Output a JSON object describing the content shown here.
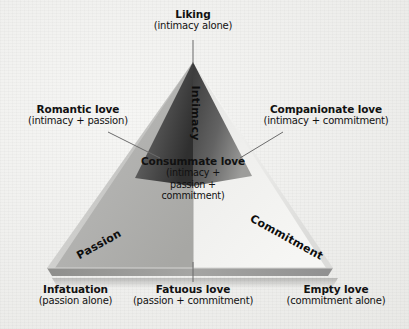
{
  "figure": {
    "name": "triangular-theory-of-love",
    "background_color": "#f1f1ef"
  },
  "vertices": {
    "top": {
      "title": "Liking",
      "subtitle": "(intimacy alone)"
    },
    "bottom_left": {
      "title": "Infatuation",
      "subtitle": "(passion alone)"
    },
    "bottom_right": {
      "title": "Empty love",
      "subtitle": "(commitment alone)"
    }
  },
  "sides": {
    "left": {
      "title": "Romantic love",
      "subtitle": "(intimacy + passion)"
    },
    "right": {
      "title": "Companionate love",
      "subtitle": "(intimacy + commitment)"
    },
    "bottom": {
      "title": "Fatuous love",
      "subtitle": "(passion + commitment)"
    }
  },
  "center": {
    "title": "Consummate love",
    "subtitle_line1": "(intimacy +",
    "subtitle_line2": "passion +",
    "subtitle_line3": "commitment)"
  },
  "faces": {
    "intimacy": "Intimacy",
    "passion": "Passion",
    "commitment": "Commitment"
  },
  "colors": {
    "intimacy_dark": "#3c3c3c",
    "intimacy_light": "#8f8f8f",
    "passion_mid": "#b4b4b2",
    "commitment_light": "#ededeb",
    "edge_shadow": "#9a9a98",
    "leader_line": "#6b6b6b",
    "text": "#111111"
  }
}
